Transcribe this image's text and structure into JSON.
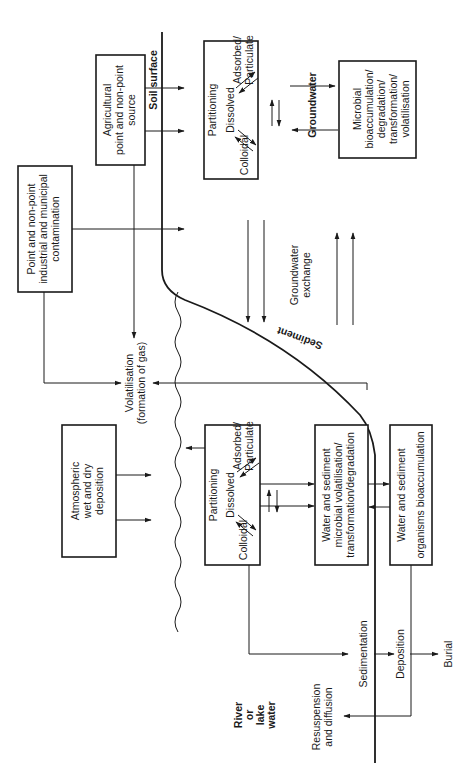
{
  "diagram": {
    "orientation": "rotated-90-ccw",
    "boundaries": {
      "soil_surface": "Soil surface",
      "sediment": "Sediment",
      "river_or_lake_water": [
        "River",
        "or",
        "lake",
        "water"
      ]
    },
    "sources": {
      "agricultural": [
        "Agricultural",
        "point and non-point",
        "source"
      ],
      "point_nonpoint": [
        "Point and non-point",
        "industrial and municipal",
        "contamination"
      ],
      "atmospheric": [
        "Atmospheric",
        "wet and dry",
        "deposition"
      ]
    },
    "soil_partitioning": {
      "title": "Partitioning",
      "dissolved": "Dissolved",
      "adsorbed": [
        "Adsorbed/",
        "Particulate"
      ],
      "colloidal": "Colloidal"
    },
    "groundwater_label": "Groundwater",
    "microbial_box": [
      "Microbial",
      "bioaccumulation/",
      "degradation/",
      "transformation/",
      "volatilisation"
    ],
    "groundwater_exchange": [
      "Groundwater",
      "exchange"
    ],
    "volatilisation": [
      "Volatilisation",
      "(formation of gas)"
    ],
    "water_partitioning": {
      "title": "Partitioning",
      "dissolved": "Dissolved",
      "adsorbed": [
        "Adsorbed/",
        "Particulate"
      ],
      "colloidal": "Colloidal"
    },
    "water_sediment_microbial": [
      "Water and sediment",
      "microbial volatilisation/",
      "transformation/degradation"
    ],
    "water_sediment_organisms": [
      "Water and sediment",
      "organisms bioaccumulation"
    ],
    "sedimentation": "Sedimentation",
    "deposition": "Deposition",
    "burial": "Burial",
    "resuspension": [
      "Resuspension",
      "and diffusion"
    ]
  }
}
